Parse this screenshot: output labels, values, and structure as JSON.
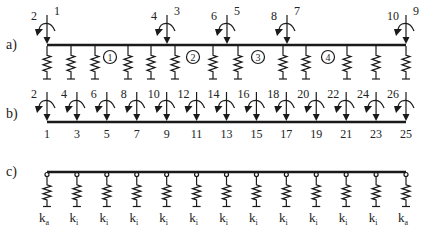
{
  "figure": {
    "colors": {
      "ink": "#1a1a1a",
      "background": "#ffffff"
    },
    "panel_a": {
      "label": "a)",
      "beam": {
        "x_start": 47,
        "x_end": 406,
        "y": 45
      },
      "nodes": [
        {
          "x": 47,
          "rotation_dof": "2",
          "translation_dof": "1"
        },
        {
          "x": 167,
          "rotation_dof": "4",
          "translation_dof": "3"
        },
        {
          "x": 227,
          "rotation_dof": "6",
          "translation_dof": "5"
        },
        {
          "x": 287,
          "rotation_dof": "8",
          "translation_dof": "7"
        },
        {
          "x": 406,
          "rotation_dof": "10",
          "translation_dof": "9"
        }
      ],
      "springs_x": [
        47,
        71,
        95,
        128,
        151,
        175,
        213,
        238,
        283,
        306,
        347,
        376,
        406
      ],
      "elements": [
        {
          "label": "1",
          "x": 110
        },
        {
          "label": "2",
          "x": 193
        },
        {
          "label": "3",
          "x": 258
        },
        {
          "label": "4",
          "x": 328
        }
      ]
    },
    "panel_b": {
      "label": "b)",
      "beam": {
        "x_start": 47,
        "x_end": 406,
        "y": 122
      },
      "nodes": [
        {
          "rotation_dof": "2",
          "translation_dof": "1"
        },
        {
          "rotation_dof": "4",
          "translation_dof": "3"
        },
        {
          "rotation_dof": "6",
          "translation_dof": "5"
        },
        {
          "rotation_dof": "8",
          "translation_dof": "7"
        },
        {
          "rotation_dof": "10",
          "translation_dof": "9"
        },
        {
          "rotation_dof": "12",
          "translation_dof": "11"
        },
        {
          "rotation_dof": "14",
          "translation_dof": "13"
        },
        {
          "rotation_dof": "16",
          "translation_dof": "15"
        },
        {
          "rotation_dof": "18",
          "translation_dof": "17"
        },
        {
          "rotation_dof": "20",
          "translation_dof": "19"
        },
        {
          "rotation_dof": "22",
          "translation_dof": "21"
        },
        {
          "rotation_dof": "24",
          "translation_dof": "23"
        },
        {
          "rotation_dof": "26",
          "translation_dof": "25"
        }
      ]
    },
    "panel_c": {
      "label": "c)",
      "beam": {
        "x_start": 47,
        "x_end": 406,
        "y": 172
      },
      "springs": [
        {
          "k": "k",
          "sub": "a"
        },
        {
          "k": "k",
          "sub": "i"
        },
        {
          "k": "k",
          "sub": "i"
        },
        {
          "k": "k",
          "sub": "i"
        },
        {
          "k": "k",
          "sub": "i"
        },
        {
          "k": "k",
          "sub": "i"
        },
        {
          "k": "k",
          "sub": "i"
        },
        {
          "k": "k",
          "sub": "i"
        },
        {
          "k": "k",
          "sub": "i"
        },
        {
          "k": "k",
          "sub": "i"
        },
        {
          "k": "k",
          "sub": "i"
        },
        {
          "k": "k",
          "sub": "i"
        },
        {
          "k": "k",
          "sub": "a"
        }
      ]
    }
  }
}
